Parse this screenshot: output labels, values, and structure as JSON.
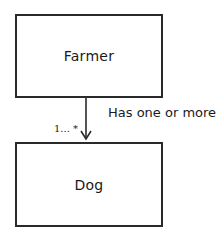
{
  "diagram": {
    "type": "uml-class-association",
    "classes": [
      {
        "id": "farmer",
        "label": "Farmer"
      },
      {
        "id": "dog",
        "label": "Dog"
      }
    ],
    "association": {
      "from": "farmer",
      "to": "dog",
      "label": "Has one or more",
      "multiplicity": "1... *",
      "arrow": "open-arrow-down"
    }
  },
  "colors": {
    "stroke": "#2a2a2a",
    "text": "#1a1a1a",
    "background": "#ffffff"
  }
}
